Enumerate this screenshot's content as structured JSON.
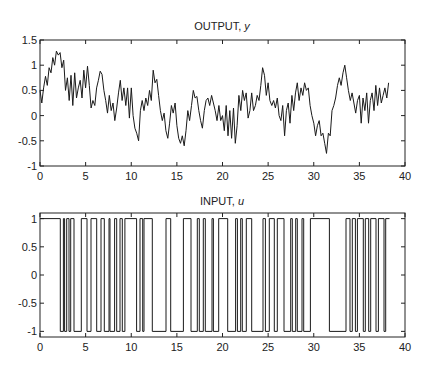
{
  "chart_data": [
    {
      "type": "line",
      "title": "OUTPUT, y",
      "title_main": "OUTPUT, ",
      "title_var": "y",
      "xlabel": "",
      "ylabel": "",
      "xlim": [
        0,
        40
      ],
      "ylim": [
        -1,
        1.5
      ],
      "xticks": [
        0,
        5,
        10,
        15,
        20,
        25,
        30,
        35,
        40
      ],
      "yticks": [
        -1,
        -0.5,
        0,
        0.5,
        1,
        1.5
      ],
      "ytick_labels": [
        "-1",
        "-0.5",
        "0",
        "0.5",
        "1",
        "1.5"
      ],
      "grid": false,
      "series": [
        {
          "name": "y",
          "color": "#1a1a1a",
          "x": [
            0,
            0.2,
            0.4,
            0.6,
            0.8,
            1.0,
            1.2,
            1.4,
            1.6,
            1.8,
            2.0,
            2.2,
            2.4,
            2.6,
            2.8,
            3.0,
            3.2,
            3.4,
            3.6,
            3.8,
            4.0,
            4.2,
            4.4,
            4.6,
            4.8,
            5.0,
            5.2,
            5.4,
            5.6,
            5.8,
            6.0,
            6.2,
            6.4,
            6.6,
            6.8,
            7.0,
            7.2,
            7.4,
            7.6,
            7.8,
            8.0,
            8.2,
            8.4,
            8.6,
            8.8,
            9.0,
            9.2,
            9.4,
            9.6,
            9.8,
            10.0,
            10.2,
            10.4,
            10.6,
            10.8,
            11.0,
            11.2,
            11.4,
            11.6,
            11.8,
            12.0,
            12.2,
            12.4,
            12.6,
            12.8,
            13.0,
            13.2,
            13.4,
            13.6,
            13.8,
            14.0,
            14.2,
            14.4,
            14.6,
            14.8,
            15.0,
            15.2,
            15.4,
            15.6,
            15.8,
            16.0,
            16.2,
            16.4,
            16.6,
            16.8,
            17.0,
            17.2,
            17.4,
            17.6,
            17.8,
            18.0,
            18.2,
            18.4,
            18.6,
            18.8,
            19.0,
            19.2,
            19.4,
            19.6,
            19.8,
            20.0,
            20.2,
            20.4,
            20.6,
            20.8,
            21.0,
            21.2,
            21.4,
            21.6,
            21.8,
            22.0,
            22.2,
            22.4,
            22.6,
            22.8,
            23.0,
            23.2,
            23.4,
            23.6,
            23.8,
            24.0,
            24.2,
            24.4,
            24.6,
            24.8,
            25.0,
            25.2,
            25.4,
            25.6,
            25.8,
            26.0,
            26.2,
            26.4,
            26.6,
            26.8,
            27.0,
            27.2,
            27.4,
            27.6,
            27.8,
            28.0,
            28.2,
            28.4,
            28.6,
            28.8,
            29.0,
            29.2,
            29.4,
            29.6,
            29.8,
            30.0,
            30.2,
            30.4,
            30.6,
            30.8,
            31.0,
            31.2,
            31.4,
            31.6,
            31.8,
            32.0,
            32.2,
            32.4,
            32.6,
            32.8,
            33.0,
            33.2,
            33.4,
            33.6,
            33.8,
            34.0,
            34.2,
            34.4,
            34.6,
            34.8,
            35.0,
            35.2,
            35.4,
            35.6,
            35.8,
            36.0,
            36.2,
            36.4,
            36.6,
            36.8,
            37.0,
            37.2,
            37.4,
            37.6,
            37.8,
            38.0,
            38.2
          ],
          "y": [
            0.5,
            0.25,
            0.55,
            0.78,
            0.6,
            0.95,
            0.85,
            1.15,
            1.0,
            1.28,
            1.2,
            1.25,
            0.95,
            1.1,
            0.5,
            0.75,
            0.3,
            0.8,
            0.2,
            0.85,
            0.35,
            0.55,
            0.7,
            0.35,
            0.9,
            0.55,
            0.98,
            0.6,
            0.15,
            0.3,
            0.2,
            0.55,
            0.7,
            0.88,
            0.82,
            0.5,
            0.3,
            0.05,
            0.4,
            0.1,
            0.25,
            -0.1,
            0.15,
            0.45,
            0.7,
            0.3,
            0.55,
            0.2,
            0.55,
            -0.05,
            0.55,
            0.0,
            -0.25,
            -0.35,
            -0.5,
            0.1,
            0.3,
            0.1,
            0.35,
            0.2,
            0.5,
            0.3,
            0.9,
            0.65,
            0.72,
            0.4,
            0.1,
            -0.1,
            0.05,
            -0.3,
            -0.45,
            -0.15,
            0.2,
            0.05,
            0.25,
            -0.2,
            -0.45,
            -0.55,
            -0.4,
            -0.6,
            -0.3,
            0.1,
            -0.1,
            0.2,
            0.5,
            0.35,
            0.38,
            0.1,
            -0.1,
            -0.25,
            0.1,
            0.3,
            0.35,
            0.2,
            0.4,
            0.25,
            0.1,
            -0.1,
            0.2,
            -0.1,
            0.0,
            -0.3,
            0.2,
            -0.4,
            0.1,
            -0.45,
            0.15,
            -0.55,
            -0.2,
            0.4,
            0.1,
            0.5,
            0.3,
            0.45,
            -0.05,
            0.1,
            0.45,
            0.1,
            0.2,
            0.4,
            0.3,
            0.6,
            0.95,
            0.8,
            0.4,
            0.65,
            0.3,
            0.2,
            0.3,
            0.15,
            0.35,
            0.0,
            -0.1,
            0.2,
            -0.4,
            0.1,
            0.25,
            -0.15,
            0.4,
            0.1,
            0.45,
            0.65,
            0.3,
            0.55,
            0.4,
            0.65,
            0.5,
            0.55,
            0.2,
            0.0,
            -0.15,
            -0.4,
            -0.2,
            -0.1,
            -0.4,
            -0.35,
            -0.55,
            -0.75,
            -0.35,
            -0.4,
            0.1,
            0.2,
            0.35,
            0.6,
            0.75,
            0.6,
            0.85,
            1.0,
            0.75,
            0.5,
            0.3,
            0.45,
            0.25,
            0.05,
            0.3,
            0.4,
            -0.15,
            0.35,
            0.1,
            0.45,
            -0.15,
            0.3,
            0.45,
            0.1,
            0.6,
            0.2,
            0.55,
            0.25,
            0.4,
            0.55,
            0.35,
            0.65
          ]
        }
      ]
    },
    {
      "type": "line",
      "step": true,
      "title": "INPUT, u",
      "title_main": "INPUT, ",
      "title_var": "u",
      "xlabel": "",
      "ylabel": "",
      "xlim": [
        0,
        40
      ],
      "ylim": [
        -1.1,
        1.1
      ],
      "xticks": [
        0,
        5,
        10,
        15,
        20,
        25,
        30,
        35,
        40
      ],
      "yticks": [
        -1,
        -0.5,
        0,
        0.5,
        1
      ],
      "ytick_labels": [
        "-1",
        "-0.5",
        "0",
        "0.5",
        "1"
      ],
      "grid": false,
      "series": [
        {
          "name": "u",
          "color": "#1a1a1a",
          "initial_value": 1,
          "switch_times": [
            2.23,
            2.56,
            2.7,
            2.93,
            3.18,
            3.36,
            3.73,
            4.53,
            5.15,
            5.59,
            6.21,
            6.68,
            7.05,
            7.56,
            7.67,
            8.18,
            8.4,
            8.77,
            9.02,
            9.3,
            10.59,
            10.96,
            11.25,
            11.4,
            12.31,
            13.81,
            14.32,
            15.71,
            16.55,
            17.24,
            17.46,
            17.9,
            18.12,
            18.85,
            19.0,
            19.58,
            20.57,
            21.44,
            21.63,
            21.99,
            22.17,
            22.61,
            23.2,
            24.44,
            24.7,
            25.13,
            25.68,
            26.01,
            26.74,
            27.47,
            27.65,
            28.02,
            28.2,
            28.71,
            28.9,
            29.63,
            31.71,
            33.53,
            33.97,
            34.23,
            34.56,
            34.78,
            35.43,
            35.65,
            36.02,
            36.24,
            36.82,
            37.08,
            37.7,
            37.88
          ],
          "x_end": 38.3
        }
      ]
    }
  ]
}
